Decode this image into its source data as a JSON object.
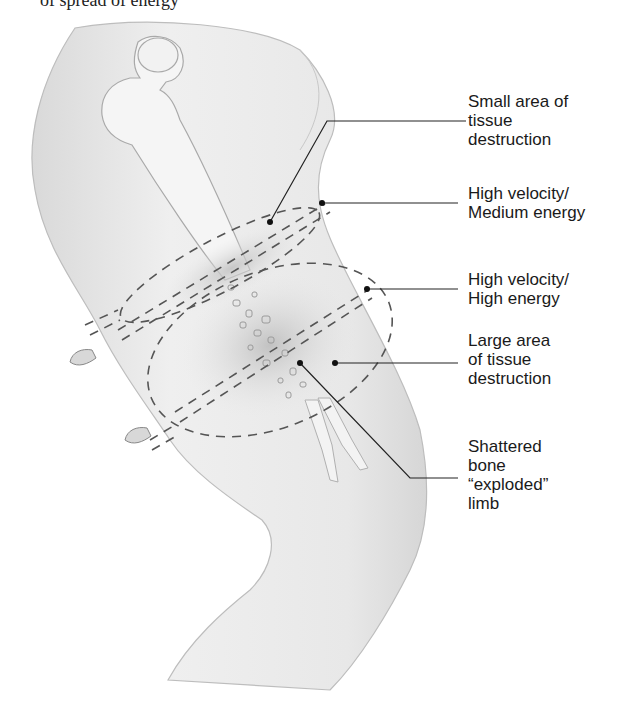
{
  "figure": {
    "top_caption": "of spread of energy",
    "colors": {
      "skin_fill": "#ececec",
      "skin_outline": "#b8b8b8",
      "bone_fill": "#f4f4f4",
      "bone_outline": "#a8a8a8",
      "dash": "#555555",
      "leader": "#222222",
      "bruise": "#c9c9c9"
    },
    "labels": [
      {
        "id": "small-area",
        "text": "Small area of\ntissue\ndestruction"
      },
      {
        "id": "hv-medium",
        "text": "High velocity/\nMedium energy"
      },
      {
        "id": "hv-high",
        "text": "High velocity/\nHigh energy"
      },
      {
        "id": "large-area",
        "text": "Large area\nof tissue\ndestruction"
      },
      {
        "id": "shattered",
        "text": "Shattered\nbone\n“exploded”\nlimb"
      }
    ]
  }
}
